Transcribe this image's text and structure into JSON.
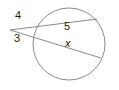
{
  "figure": {
    "background_color": "#ffffff",
    "stroke_color": "#8a8a8a",
    "label_color": "#1a1a1a",
    "stroke_width": 1,
    "circle": {
      "name": "circle",
      "cx": 69,
      "cy": 44,
      "r": 36
    },
    "external_point": {
      "name": "external-vertex",
      "x": 10,
      "y": 30
    },
    "secants": [
      {
        "name": "upper-secant",
        "x1": 10,
        "y1": 30,
        "x2": 97,
        "y2": 19,
        "external_segment_label": "4",
        "chord_label": "5"
      },
      {
        "name": "lower-secant",
        "x1": 10,
        "y1": 30,
        "x2": 101,
        "y2": 58,
        "external_segment_label": "3",
        "chord_label": "x"
      }
    ],
    "labels": {
      "upper_external": "4",
      "lower_external": "3",
      "upper_chord": "5",
      "lower_chord": "x"
    }
  }
}
